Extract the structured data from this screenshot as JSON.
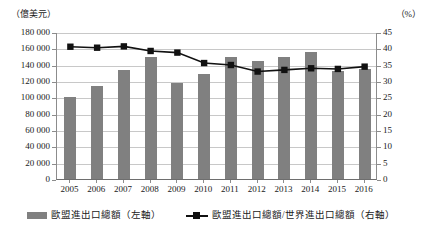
{
  "axes": {
    "left_unit": "（億美元）",
    "right_unit": "（%）",
    "left_ticks": [
      "180 000",
      "160 000",
      "140 000",
      "120 000",
      "100 000",
      "80 000",
      "60 000",
      "40 000",
      "20 000",
      "0"
    ],
    "right_ticks": [
      "45",
      "40",
      "35",
      "30",
      "25",
      "20",
      "15",
      "10",
      "5",
      "0"
    ]
  },
  "legend": {
    "bar_label": "歐盟進出口總額（左軸）",
    "line_label": "歐盟進出口總額/世界進出口總額（右軸）",
    "bar_icon": "bar-swatch-icon",
    "line_icon": "line-marker-swatch-icon"
  },
  "colors": {
    "bar": "#808080",
    "line": "#111111",
    "grid": "#c8c8c8",
    "axis": "#8c8c8c",
    "background": "#ffffff"
  },
  "chart_data": {
    "type": "bar",
    "title": "",
    "xlabel": "",
    "ylabel": "（億美元）",
    "y2label": "（%）",
    "grid": true,
    "legend_position": "bottom",
    "categories": [
      "2005",
      "2006",
      "2007",
      "2008",
      "2009",
      "2010",
      "2011",
      "2012",
      "2013",
      "2014",
      "2015",
      "2016"
    ],
    "ylim": [
      0,
      180000
    ],
    "ytick_step": 20000,
    "y2lim": [
      0,
      45
    ],
    "y2tick_step": 5,
    "series": [
      {
        "name": "歐盟進出口總額（左軸）",
        "type": "bar",
        "axis": "left",
        "unit": "億美元",
        "values": [
          100000,
          114000,
          134000,
          150000,
          117000,
          129000,
          150000,
          144000,
          149000,
          155000,
          132000,
          135000
        ]
      },
      {
        "name": "歐盟進出口總額/世界進出口總額（右軸）",
        "type": "line",
        "axis": "right",
        "unit": "%",
        "marker": "square",
        "values": [
          40.8,
          40.5,
          40.9,
          39.5,
          39.0,
          35.8,
          35.2,
          33.2,
          33.7,
          34.2,
          34.0,
          34.7
        ]
      }
    ]
  }
}
